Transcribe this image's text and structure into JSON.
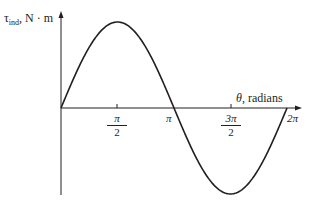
{
  "chart_data": {
    "type": "line",
    "title": "",
    "xlabel": "θ, radians",
    "ylabel": "τind, N·m",
    "ylabel_main": "τ",
    "ylabel_sub": "ind",
    "ylabel_unit": ", N · m",
    "xlabel_symbol": "θ",
    "xlabel_unit": ", radians",
    "xlim": [
      0,
      6.2832
    ],
    "ylim": [
      -1,
      1
    ],
    "grid": false,
    "legend": null,
    "x_ticks": [
      {
        "value": 1.5708,
        "label_num": "π",
        "label_den": "2"
      },
      {
        "value": 3.1416,
        "label": "π"
      },
      {
        "value": 4.7124,
        "label_num": "3π",
        "label_den": "2"
      },
      {
        "value": 6.2832,
        "label": "2π"
      }
    ],
    "series": [
      {
        "name": "τind = sin θ",
        "color": "#231f20",
        "x": [
          0,
          0.7854,
          1.5708,
          2.3562,
          3.1416,
          3.927,
          4.7124,
          5.4978,
          6.2832
        ],
        "values": [
          0,
          0.707,
          1,
          0.707,
          0,
          -0.707,
          -1,
          -0.707,
          0
        ]
      }
    ]
  }
}
